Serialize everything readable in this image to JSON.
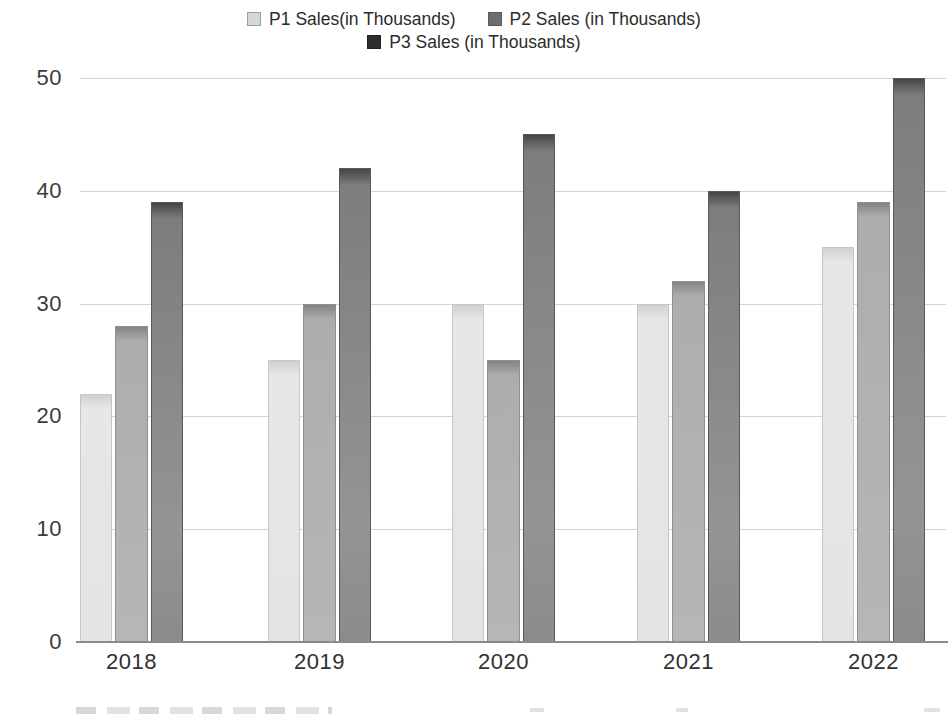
{
  "legend": {
    "items": [
      {
        "label": "P1 Sales(in Thousands)",
        "color": "#d6d6d6",
        "border": "#9e9e9e"
      },
      {
        "label": "P2 Sales (in Thousands)",
        "color": "#6e6e6e",
        "border": "#5a5a5a"
      },
      {
        "label": "P3 Sales (in Thousands)",
        "color": "#2e2e2e",
        "border": "#222222"
      }
    ]
  },
  "chart_data": {
    "type": "bar",
    "title": "",
    "xlabel": "",
    "ylabel": "",
    "categories": [
      "2018",
      "2019",
      "2020",
      "2021",
      "2022"
    ],
    "series": [
      {
        "name": "P1 Sales(in Thousands)",
        "values": [
          22,
          25,
          30,
          30,
          35
        ],
        "color": "#e4e4e4"
      },
      {
        "name": "P2 Sales (in Thousands)",
        "values": [
          28,
          30,
          25,
          32,
          39
        ],
        "color": "#b0b0b0"
      },
      {
        "name": "P3 Sales (in Thousands)",
        "values": [
          39,
          42,
          45,
          40,
          50
        ],
        "color": "#8b8b8b"
      }
    ],
    "ylim": [
      0,
      50
    ],
    "yticks": [
      0,
      10,
      20,
      30,
      40,
      50
    ],
    "grid": "horizontal",
    "legend_position": "top"
  }
}
